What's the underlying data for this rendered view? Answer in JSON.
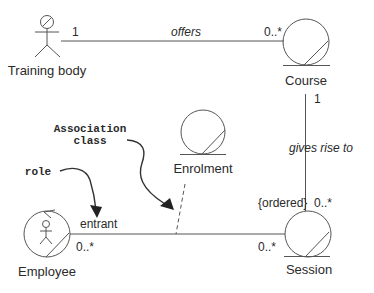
{
  "diagram": {
    "type": "UML class diagram (robustness / entity notation)",
    "classes": [
      {
        "id": "training_body",
        "label": "Training body",
        "stereotype": "actor"
      },
      {
        "id": "course",
        "label": "Course",
        "stereotype": "entity"
      },
      {
        "id": "enrolment",
        "label": "Enrolment",
        "stereotype": "entity"
      },
      {
        "id": "session",
        "label": "Session",
        "stereotype": "entity"
      },
      {
        "id": "employee",
        "label": "Employee",
        "stereotype": "actor-entity"
      }
    ],
    "associations": [
      {
        "name": "offers",
        "from": "training_body",
        "to": "course",
        "from_mult": "1",
        "to_mult": "0..*"
      },
      {
        "name": "gives rise to",
        "from": "course",
        "to": "session",
        "from_mult": "1",
        "to_mult": "0..*",
        "constraint": "{ordered}"
      },
      {
        "name": "",
        "from": "employee",
        "to": "session",
        "role": "entrant",
        "from_mult": "0..*",
        "to_mult": "0..*",
        "association_class": "enrolment"
      }
    ],
    "annotations": [
      {
        "id": "association_class_note",
        "line1": "Association",
        "line2": "class"
      },
      {
        "id": "role_note",
        "text": "role"
      }
    ]
  },
  "labels": {
    "training_body": "Training body",
    "course": "Course",
    "enrolment": "Enrolment",
    "session": "Session",
    "employee": "Employee",
    "offers": "offers",
    "offers_mult_left": "1",
    "offers_mult_right": "0..*",
    "gives_rise_to": "gives rise to",
    "gives_mult_top": "1",
    "gives_mult_bottom": "0..*",
    "ordered": "{ordered}",
    "entrant": "entrant",
    "emp_mult": "0..*",
    "session_mult": "0..*",
    "assoc_class_line1": "Association",
    "assoc_class_line2": "class",
    "role": "role"
  }
}
